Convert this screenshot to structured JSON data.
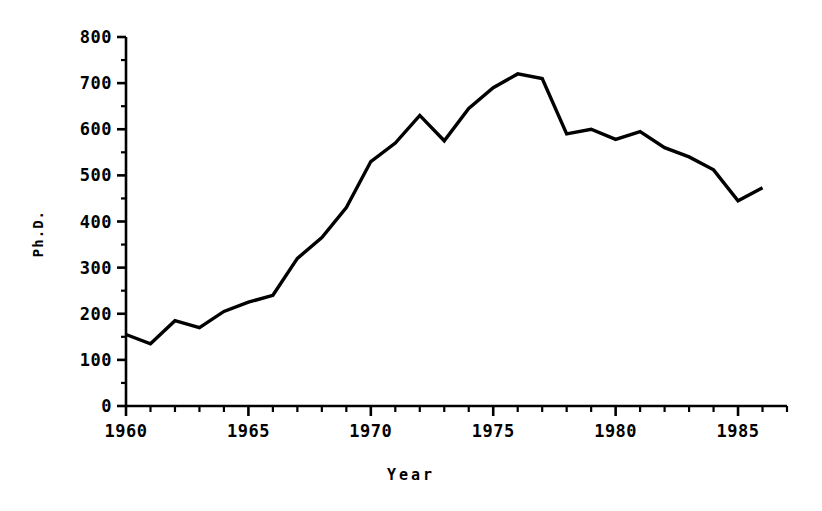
{
  "chart_data": {
    "type": "line",
    "title": "",
    "xlabel": "Year",
    "ylabel": "Ph.D.",
    "xlim": [
      1960,
      1987
    ],
    "ylim": [
      0,
      800
    ],
    "grid": false,
    "legend": "none",
    "x_major_ticks": [
      1960,
      1965,
      1970,
      1975,
      1980,
      1985
    ],
    "x_major_tick_labels": [
      "1960",
      "1965",
      "1970",
      "1975",
      "1980",
      "1985"
    ],
    "x_minor_tick_step": 1,
    "y_major_ticks": [
      0,
      100,
      200,
      300,
      400,
      500,
      600,
      700,
      800
    ],
    "y_major_tick_labels": [
      "0",
      "100",
      "200",
      "300",
      "400",
      "500",
      "600",
      "700",
      "800"
    ],
    "y_minor_tick_step": 50,
    "series": [
      {
        "name": "Ph.D.",
        "color": "#000000",
        "x": [
          1960,
          1961,
          1962,
          1963,
          1964,
          1965,
          1966,
          1967,
          1968,
          1969,
          1970,
          1971,
          1972,
          1973,
          1974,
          1975,
          1976,
          1977,
          1978,
          1979,
          1980,
          1981,
          1982,
          1983,
          1984,
          1985,
          1986
        ],
        "values": [
          155,
          135,
          185,
          170,
          205,
          225,
          240,
          320,
          365,
          430,
          530,
          570,
          630,
          575,
          645,
          690,
          720,
          710,
          590,
          600,
          578,
          595,
          560,
          540,
          512,
          445,
          473
        ]
      }
    ]
  },
  "axis": {
    "y_title": "Ph.D.",
    "x_title": "Year"
  }
}
